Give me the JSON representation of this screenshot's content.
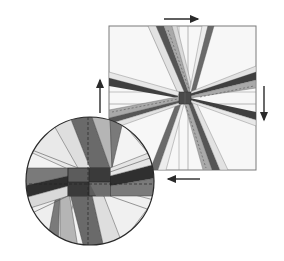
{
  "figure": {
    "colors": {
      "background": "#ffffff",
      "outline": "#6e6e6e",
      "dark": "#3a3a3a",
      "medium": "#7a7a7a",
      "medium_light": "#a8a8a8",
      "light": "#d6d6d6",
      "very_light": "#eeeeee",
      "arrow": "#2a2a2a"
    },
    "square": {
      "x": 109,
      "y": 26,
      "width": 147,
      "height": 144,
      "center_x": 184,
      "center_y": 98
    },
    "circle_detail": {
      "cx": 90,
      "cy": 181,
      "r": 64
    },
    "arrows": [
      {
        "name": "top",
        "direction": "right",
        "x1": 164,
        "y1": 19,
        "x2": 200,
        "y2": 19
      },
      {
        "name": "right",
        "direction": "down",
        "x1": 264,
        "y1": 86,
        "x2": 264,
        "y2": 122
      },
      {
        "name": "bottom",
        "direction": "left",
        "x1": 200,
        "y1": 179,
        "x2": 166,
        "y2": 179
      },
      {
        "name": "left",
        "direction": "up",
        "x1": 100,
        "y1": 113,
        "x2": 100,
        "y2": 78
      }
    ]
  }
}
